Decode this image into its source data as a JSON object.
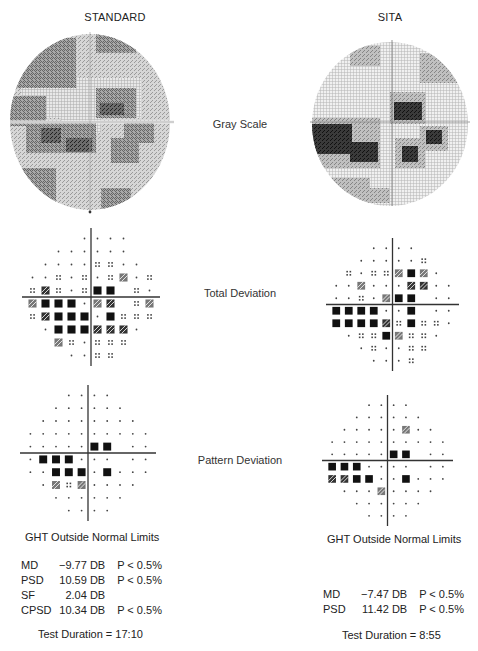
{
  "columns": [
    {
      "title": "STANDARD"
    },
    {
      "title": "SITA"
    }
  ],
  "row_labels": {
    "gray_scale": "Gray Scale",
    "total_deviation": "Total Deviation",
    "pattern_deviation": "Pattern Deviation"
  },
  "standard": {
    "ght": "GHT Outside Normal Limits",
    "stats": [
      {
        "label": "MD",
        "value": "−9.77 DB",
        "p": "P < 0.5%"
      },
      {
        "label": "PSD",
        "value": "10.59 DB",
        "p": "P < 0.5%"
      },
      {
        "label": "SF",
        "value": "2.04 DB",
        "p": ""
      },
      {
        "label": "CPSD",
        "value": "10.34 DB",
        "p": "P < 0.5%"
      }
    ],
    "duration": "Test Duration = 17:10"
  },
  "sita": {
    "ght": "GHT Outside Normal Limits",
    "stats": [
      {
        "label": "MD",
        "value": "−7.47 DB",
        "p": "P < 0.5%"
      },
      {
        "label": "PSD",
        "value": "11.42 DB",
        "p": "P < 0.5%"
      }
    ],
    "duration": "Test Duration = 8:55"
  },
  "symbol_legend": {
    "dot": "normal",
    "dots4": "P < 5%",
    "checker": "P < 2%",
    "dense": "P < 1%",
    "black": "P < 0.5%"
  },
  "plots": {
    "std_total": [
      [
        0,
        0,
        0,
        0,
        "a",
        "a",
        "a",
        "a",
        0,
        0
      ],
      [
        0,
        0,
        "a",
        "a",
        "a",
        "a",
        "a",
        "a",
        0,
        0
      ],
      [
        0,
        "a",
        "a",
        "a",
        "a",
        "f",
        "f",
        "a",
        "a",
        0
      ],
      [
        "a",
        "a",
        "f",
        "a",
        "f",
        "a",
        "f",
        "c",
        "a",
        "f"
      ],
      [
        "f",
        "d",
        "f",
        "a",
        "f",
        "k",
        "k",
        0,
        "f",
        "a"
      ],
      [
        "c",
        "k",
        "k",
        "k",
        "a",
        "c",
        "d",
        0,
        "f",
        "c"
      ],
      [
        "f",
        "d",
        "k",
        "k",
        "k",
        "a",
        "k",
        "f",
        "f",
        "f"
      ],
      [
        0,
        "a",
        "k",
        "k",
        "k",
        "d",
        "d",
        "d",
        "a",
        0
      ],
      [
        0,
        0,
        "c",
        "f",
        "a",
        "f",
        "f",
        "f",
        0,
        0
      ],
      [
        0,
        0,
        0,
        "a",
        "a",
        "f",
        "f",
        0,
        0,
        0
      ]
    ],
    "sita_total": [
      [
        0,
        0,
        0,
        "a",
        "a",
        "a",
        "a",
        0,
        0,
        0
      ],
      [
        0,
        0,
        "a",
        "a",
        "a",
        "a",
        "a",
        "f",
        0,
        0
      ],
      [
        0,
        "f",
        "a",
        "f",
        "f",
        "c",
        "k",
        "c",
        "a",
        0
      ],
      [
        "a",
        "a",
        "c",
        "a",
        "a",
        "a",
        "d",
        "d",
        "a",
        "a"
      ],
      [
        "a",
        "a",
        "f",
        "a",
        "c",
        "k",
        "k",
        0,
        "a",
        "a"
      ],
      [
        "k",
        "k",
        "k",
        "k",
        "a",
        "a",
        "k",
        0,
        "a",
        "a"
      ],
      [
        "k",
        "k",
        "k",
        "k",
        "d",
        "f",
        "k",
        "f",
        "f",
        "a"
      ],
      [
        0,
        "a",
        "f",
        "f",
        "k",
        "c",
        "f",
        "f",
        "a",
        0
      ],
      [
        0,
        0,
        "a",
        "f",
        "a",
        "a",
        "f",
        "f",
        0,
        0
      ],
      [
        0,
        0,
        0,
        "a",
        "a",
        "a",
        "f",
        0,
        0,
        0
      ]
    ],
    "std_pattern": [
      [
        0,
        0,
        0,
        "a",
        "a",
        "a",
        "a",
        0,
        0,
        0
      ],
      [
        0,
        0,
        "a",
        "a",
        "a",
        "a",
        "a",
        "a",
        0,
        0
      ],
      [
        0,
        "a",
        "a",
        "a",
        "a",
        "a",
        "a",
        "a",
        "a",
        0
      ],
      [
        "a",
        "a",
        "a",
        "a",
        "a",
        "a",
        "a",
        "a",
        "a",
        "a"
      ],
      [
        "a",
        "a",
        "a",
        "a",
        "a",
        "k",
        "k",
        0,
        "a",
        "a"
      ],
      [
        "a",
        "k",
        "k",
        "k",
        "a",
        "a",
        "a",
        0,
        "a",
        "a"
      ],
      [
        "a",
        "a",
        "k",
        "k",
        "k",
        "a",
        "k",
        "a",
        "a",
        "a"
      ],
      [
        0,
        "a",
        "c",
        "f",
        "c",
        "a",
        "a",
        "a",
        "a",
        0
      ],
      [
        0,
        0,
        "a",
        "a",
        "a",
        "a",
        "a",
        "a",
        0,
        0
      ],
      [
        0,
        0,
        0,
        "a",
        "a",
        "a",
        "a",
        0,
        0,
        0
      ]
    ],
    "sita_pattern": [
      [
        0,
        0,
        0,
        "a",
        "a",
        "a",
        "a",
        0,
        0,
        0
      ],
      [
        0,
        0,
        "a",
        "a",
        "a",
        "a",
        "a",
        "a",
        0,
        0
      ],
      [
        0,
        "a",
        "a",
        "a",
        "a",
        "a",
        "c",
        "a",
        "a",
        0
      ],
      [
        "a",
        "a",
        "a",
        "a",
        "a",
        "a",
        "a",
        "a",
        "a",
        "a"
      ],
      [
        "a",
        "a",
        "a",
        "a",
        "a",
        "k",
        "k",
        0,
        "a",
        "a"
      ],
      [
        "k",
        "k",
        "k",
        "a",
        "a",
        "a",
        "a",
        0,
        "a",
        "a"
      ],
      [
        "d",
        "d",
        "k",
        "k",
        "a",
        "a",
        "k",
        "a",
        "a",
        "a"
      ],
      [
        0,
        "a",
        "a",
        "a",
        "c",
        "a",
        "a",
        "a",
        "a",
        0
      ],
      [
        0,
        0,
        "a",
        "a",
        "a",
        "a",
        "a",
        "a",
        0,
        0
      ],
      [
        0,
        0,
        0,
        "a",
        "a",
        "a",
        "a",
        0,
        0,
        0
      ]
    ]
  }
}
